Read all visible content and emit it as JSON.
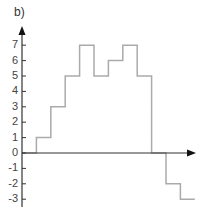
{
  "panel_label": "b)",
  "chart_data": {
    "type": "line",
    "style": "step",
    "title": "",
    "xlabel": "",
    "ylabel": "",
    "ylim": [
      -3,
      7
    ],
    "yticks": [
      7,
      6,
      5,
      4,
      3,
      2,
      1,
      0,
      -1,
      -2,
      -3
    ],
    "ytick_labels": [
      "7",
      "6",
      "5",
      "4",
      "3",
      "2",
      "1",
      "0",
      "-1",
      "-2",
      "-3"
    ],
    "grid": false,
    "legend": null,
    "series": [
      {
        "name": "step",
        "x": [
          0,
          1,
          2,
          3,
          4,
          5,
          6,
          7,
          8,
          9,
          10,
          11
        ],
        "values": [
          0,
          1,
          3,
          5,
          7,
          5,
          6,
          7,
          5,
          0,
          -2,
          -3
        ]
      }
    ]
  },
  "colors": {
    "axis": "#333333",
    "line": "#aaaaaa",
    "text": "#444444"
  }
}
